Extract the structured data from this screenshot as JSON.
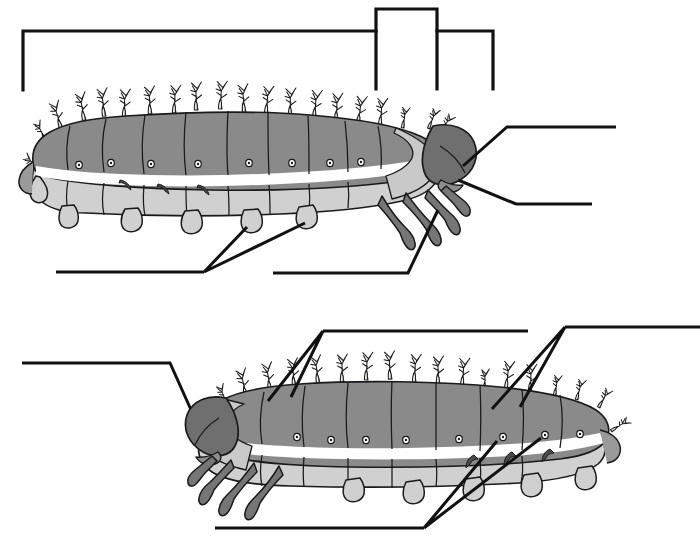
{
  "worksheet": {
    "title": "Caterpillar (larva) anatomy worksheet",
    "subtitle": "Unlabeled lateral views with blank answer lines",
    "background_color": "#ffffff",
    "ink_color": "#111111",
    "figure_count": 2,
    "answer_lines_total": 9
  },
  "palette": {
    "dorsal_gray": "#8a8a8a",
    "dorsal_gray_dark": "#7a7a7a",
    "ventral_gray": "#c9c9c9",
    "ventral_gray_light": "#d6d6d6",
    "head_capsule": "#6f6f6f",
    "leg_gray": "#767676",
    "stripe_white": "#ffffff",
    "outline": "#1a1a1a",
    "seta_fill": "#f2f0ea",
    "line_color": "#111111"
  },
  "figures": [
    {
      "id": "figure-top",
      "name": "top-caterpillar",
      "orientation": "head-right",
      "segments": 10,
      "spiracles": 9,
      "prolegs": 4,
      "thoracic_legs": 3,
      "seta_tufts": 16,
      "features": [
        "head-capsule",
        "thoracic-legs",
        "prolegs",
        "spiracles",
        "lateral-white-stripe",
        "dorsal-setae-tufts"
      ]
    },
    {
      "id": "figure-bottom",
      "name": "bottom-caterpillar",
      "orientation": "head-left",
      "segments": 10,
      "spiracles": 8,
      "prolegs": 4,
      "thoracic_legs": 3,
      "seta_tufts": 15,
      "features": [
        "head-capsule",
        "thoracic-legs",
        "prolegs",
        "spiracles",
        "lateral-white-stripe",
        "dorsal-setae-tufts"
      ]
    }
  ],
  "callouts": [
    {
      "id": "bracket-top-left",
      "figure": "figure-top",
      "style": "bracket",
      "answer_text": "",
      "points_to": "body-segments"
    },
    {
      "id": "bracket-top-raised",
      "figure": "figure-top",
      "style": "bracket",
      "answer_text": "",
      "points_to": "thorax-region"
    },
    {
      "id": "bracket-top-right",
      "figure": "figure-top",
      "style": "bracket",
      "answer_text": "",
      "points_to": "head-region"
    },
    {
      "id": "leader-top-head",
      "figure": "figure-top",
      "style": "leader",
      "answer_text": "",
      "points_to": "head-capsule"
    },
    {
      "id": "leader-top-mouth",
      "figure": "figure-top",
      "style": "leader",
      "answer_text": "",
      "points_to": "mouthparts"
    },
    {
      "id": "leader-top-prolegs",
      "figure": "figure-top",
      "style": "leader-pair",
      "answer_text": "",
      "points_to": "prolegs"
    },
    {
      "id": "leader-top-legs",
      "figure": "figure-top",
      "style": "leader",
      "answer_text": "",
      "points_to": "thoracic-legs"
    },
    {
      "id": "leader-bottom-head",
      "figure": "figure-bottom",
      "style": "leader",
      "answer_text": "",
      "points_to": "head-capsule"
    },
    {
      "id": "leader-bottom-setae-left",
      "figure": "figure-bottom",
      "style": "leader-pair",
      "answer_text": "",
      "points_to": "setae-tufts"
    },
    {
      "id": "leader-bottom-setae-right",
      "figure": "figure-bottom",
      "style": "leader-pair",
      "answer_text": "",
      "points_to": "dorsal-segments"
    },
    {
      "id": "leader-bottom-spiracles",
      "figure": "figure-bottom",
      "style": "leader-pair",
      "answer_text": "",
      "points_to": "spiracles"
    }
  ]
}
